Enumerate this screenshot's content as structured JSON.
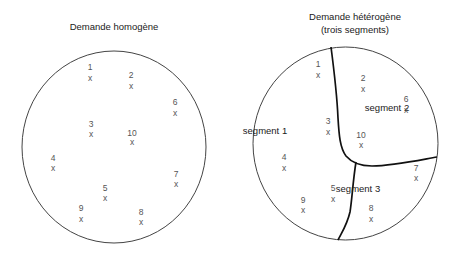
{
  "left_panel": {
    "title": "Demande homogène",
    "points": [
      {
        "label": "1",
        "mark": "x"
      },
      {
        "label": "2",
        "mark": "x"
      },
      {
        "label": "3",
        "mark": "x"
      },
      {
        "label": "4",
        "mark": "x"
      },
      {
        "label": "5",
        "mark": "x"
      },
      {
        "label": "6",
        "mark": "x"
      },
      {
        "label": "7",
        "mark": "x"
      },
      {
        "label": "8",
        "mark": "x"
      },
      {
        "label": "9",
        "mark": "x"
      },
      {
        "label": "10",
        "mark": "x"
      }
    ]
  },
  "right_panel": {
    "title_line1": "Demande hétérogène",
    "title_line2": "(trois segments)",
    "segments": [
      "segment 1",
      "segment 2",
      "segment 3"
    ],
    "points": [
      {
        "label": "1",
        "mark": "x"
      },
      {
        "label": "2",
        "mark": "x"
      },
      {
        "label": "3",
        "mark": "x"
      },
      {
        "label": "4",
        "mark": "x"
      },
      {
        "label": "5",
        "mark": "x"
      },
      {
        "label": "6",
        "mark": "x"
      },
      {
        "label": "7",
        "mark": "x"
      },
      {
        "label": "8",
        "mark": "x"
      },
      {
        "label": "9",
        "mark": "x"
      },
      {
        "label": "10",
        "mark": "x"
      }
    ]
  },
  "colors": {
    "circle_stroke": "#444444",
    "divider_stroke": "#111111",
    "point_text": "#555555",
    "title_text": "#1a1a1a"
  }
}
